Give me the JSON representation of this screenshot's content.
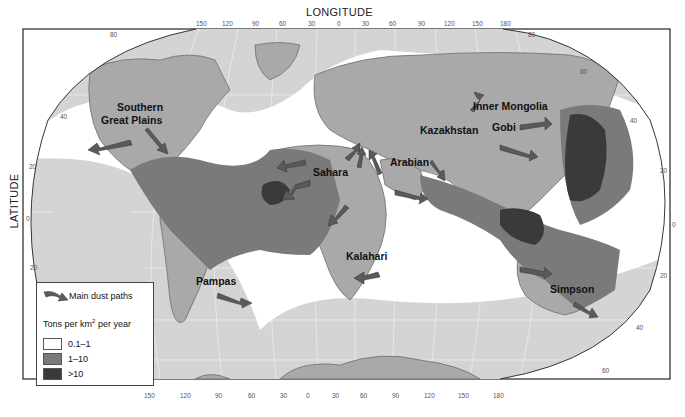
{
  "axes": {
    "longitude_title": "LONGITUDE",
    "latitude_title": "LATITUDE",
    "top_longitude_ticks": [
      "150",
      "120",
      "90",
      "60",
      "30",
      "0",
      "30",
      "60",
      "90",
      "120",
      "150",
      "180"
    ],
    "bottom_longitude_ticks": [
      "150",
      "120",
      "90",
      "60",
      "30",
      "0",
      "30",
      "60",
      "90",
      "120",
      "150",
      "180"
    ],
    "left_latitude_ticks": [
      "80",
      "40",
      "20",
      "0",
      "20"
    ],
    "right_latitude_ticks": [
      "80",
      "60",
      "40",
      "20",
      "0",
      "20",
      "40",
      "60"
    ]
  },
  "regions": [
    {
      "name": "Southern Great Plains",
      "line1": "Southern",
      "line2": "Great Plains"
    },
    {
      "name": "Sahara"
    },
    {
      "name": "Arabian"
    },
    {
      "name": "Kazakhstan"
    },
    {
      "name": "Inner Mongolia"
    },
    {
      "name": "Gobi"
    },
    {
      "name": "Kalahari"
    },
    {
      "name": "Pampas"
    },
    {
      "name": "Simpson"
    }
  ],
  "legend": {
    "paths_label": "Main dust paths",
    "units_label": "Tons per km",
    "units_sup": "2",
    "units_suffix": " per year",
    "classes": [
      {
        "label": "0.1–1",
        "color": "#ffffff"
      },
      {
        "label": "1–10",
        "color": "#7a7a7a"
      },
      {
        "label": ">10",
        "color": "#3a3a3a"
      }
    ]
  },
  "colors": {
    "ocean_low": "#d4d4d4",
    "land": "#a9a9a9",
    "dust_low": "#ffffff",
    "dust_mid": "#7a7a7a",
    "dust_high": "#3a3a3a",
    "arrow": "#5a5a5a"
  }
}
